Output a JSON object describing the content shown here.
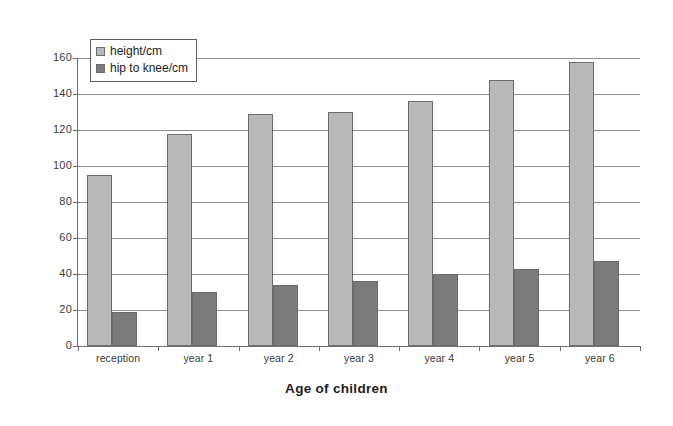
{
  "chart_data": {
    "type": "bar",
    "title": "",
    "subtitle": "",
    "xlabel": "Age of children",
    "ylabel": "",
    "categories": [
      "reception",
      "year 1",
      "year 2",
      "year 3",
      "year 4",
      "year 5",
      "year 6"
    ],
    "series": [
      {
        "name": "height/cm",
        "values": [
          95,
          118,
          129,
          130,
          136,
          148,
          158
        ],
        "color": "#b9b9b9"
      },
      {
        "name": "hip to knee/cm",
        "values": [
          19,
          30,
          34,
          36,
          40,
          43,
          47
        ],
        "color": "#7a7a7a"
      }
    ],
    "ylim": [
      0,
      160
    ],
    "ytick_step": 20,
    "yticks": [
      0,
      20,
      40,
      60,
      80,
      100,
      120,
      140,
      160
    ],
    "ytick_labels": [
      "0",
      "20",
      "40",
      "60",
      "80",
      "100",
      "120",
      "140",
      "160"
    ],
    "grid": true,
    "grid_axis": "y",
    "legend_position": "top-left",
    "legend": [
      "height/cm",
      "hip to knee/cm"
    ]
  },
  "colors": {
    "series_height": "#b9b9b9",
    "series_hip": "#7a7a7a",
    "axis": "#6f6f6f",
    "gridline": "#8d8d8d",
    "text": "#2b2b2b",
    "background": "#ffffff"
  }
}
